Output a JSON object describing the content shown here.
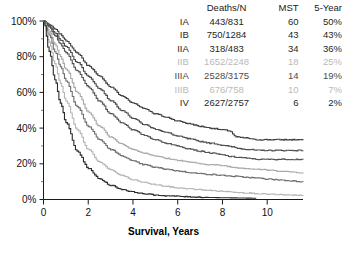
{
  "chart_data": {
    "type": "line",
    "title": "",
    "xlabel": "Survival, Years",
    "ylabel": "",
    "xlim": [
      0,
      11.6
    ],
    "ylim": [
      0,
      100
    ],
    "xticks": [
      "0",
      "2",
      "4",
      "6",
      "8",
      "10"
    ],
    "xtick_values": [
      0,
      2,
      4,
      6,
      8,
      10
    ],
    "yticks": [
      "0%",
      "20%",
      "40%",
      "60%",
      "80%",
      "100%"
    ],
    "ytick_values": [
      0,
      20,
      40,
      60,
      80,
      100
    ],
    "grid": false,
    "legend_position": "top-right",
    "series": [
      {
        "name": "IA",
        "color": "#3d3d3d",
        "deaths_n": "443/831",
        "mst": "60",
        "five_year": "50%",
        "x": [
          0,
          0.25,
          0.5,
          0.75,
          1,
          1.5,
          2,
          2.5,
          3,
          3.5,
          4,
          4.5,
          5,
          5.5,
          6,
          6.5,
          7,
          7.5,
          8,
          8.3,
          8.6,
          9,
          9.5,
          10,
          10.5,
          11,
          11.6
        ],
        "y": [
          100,
          98,
          95.5,
          92.5,
          89,
          82,
          75,
          69,
          63,
          58,
          54,
          51,
          48,
          46,
          44,
          42.5,
          41,
          40,
          39,
          38.5,
          35,
          34.5,
          33.5,
          33.5,
          33.5,
          33.5,
          33.5
        ]
      },
      {
        "name": "IB",
        "color": "#4a4a4a",
        "deaths_n": "750/1284",
        "mst": "43",
        "five_year": "43%",
        "x": [
          0,
          0.25,
          0.5,
          0.75,
          1,
          1.5,
          2,
          2.5,
          3,
          3.5,
          4,
          4.5,
          5,
          5.5,
          6,
          6.5,
          7,
          7.5,
          8,
          8.4,
          8.8,
          9.2,
          9.6,
          10,
          10.5,
          11,
          11.6
        ],
        "y": [
          100,
          97,
          93.5,
          89.5,
          85.5,
          77,
          69,
          62,
          55.5,
          50,
          45.5,
          42,
          39.5,
          37.5,
          35.5,
          34,
          32.5,
          31.5,
          30.5,
          29.5,
          28.5,
          28,
          27.5,
          27.5,
          27.5,
          27.5,
          27.5
        ]
      },
      {
        "name": "IIA",
        "color": "#525252",
        "deaths_n": "318/483",
        "mst": "34",
        "five_year": "36%",
        "x": [
          0,
          0.25,
          0.5,
          0.75,
          1,
          1.5,
          2,
          2.5,
          3,
          3.5,
          4,
          4.5,
          5,
          5.5,
          6,
          6.5,
          7,
          7.5,
          8,
          8.4,
          8.8,
          9.2,
          9.6,
          10,
          10.5,
          11,
          11.6
        ],
        "y": [
          100,
          96.5,
          92,
          87,
          82,
          72,
          63,
          55,
          48,
          43,
          39,
          36,
          33.5,
          31.5,
          30,
          28.5,
          27,
          26,
          25,
          24,
          23.5,
          23,
          22.5,
          22.5,
          22.5,
          22.5,
          22.5
        ]
      },
      {
        "name": "IIB",
        "color": "#a8a8a8",
        "deaths_n": "1652/2248",
        "mst": "18",
        "five_year": "25%",
        "x": [
          0,
          0.25,
          0.5,
          0.75,
          1,
          1.5,
          2,
          2.5,
          3,
          3.5,
          4,
          4.5,
          5,
          5.5,
          6,
          6.5,
          7,
          7.5,
          8,
          8.5,
          9,
          9.5,
          10,
          10.5,
          11,
          11.6
        ],
        "y": [
          100,
          94,
          87,
          80,
          73,
          60,
          49,
          41,
          35,
          31,
          28,
          26,
          24.5,
          23,
          22,
          21,
          20,
          19.5,
          19,
          18,
          17.5,
          17,
          16.5,
          16,
          15.5,
          15
        ]
      },
      {
        "name": "IIIA",
        "color": "#6e6e6e",
        "deaths_n": "2528/3175",
        "mst": "14",
        "five_year": "19%",
        "x": [
          0,
          0.25,
          0.5,
          0.75,
          1,
          1.5,
          2,
          2.5,
          3,
          3.5,
          4,
          4.5,
          5,
          5.5,
          6,
          6.5,
          7,
          7.5,
          8,
          8.5,
          9,
          9.5,
          10,
          10.5,
          11,
          11.6
        ],
        "y": [
          100,
          92,
          83,
          74.5,
          66.5,
          52,
          41,
          33.5,
          28,
          24.5,
          21.5,
          19.5,
          18,
          17,
          16,
          15.2,
          14.5,
          14,
          13.5,
          13,
          12.5,
          12,
          11.5,
          11,
          10.5,
          10
        ]
      },
      {
        "name": "IIIB",
        "color": "#b5b5b5",
        "deaths_n": "676/758",
        "mst": "10",
        "five_year": "7%",
        "x": [
          0,
          0.25,
          0.5,
          0.75,
          1,
          1.5,
          2,
          2.5,
          3,
          3.5,
          4,
          4.5,
          5,
          5.5,
          6,
          6.5,
          7,
          7.5,
          8,
          8.5,
          9,
          9.5,
          10,
          10.5,
          11,
          11.6
        ],
        "y": [
          100,
          88,
          76,
          65,
          55,
          39,
          28,
          21,
          16.5,
          13.5,
          11,
          9.5,
          8.3,
          7.3,
          6.5,
          6,
          5.5,
          5,
          4.6,
          4.2,
          3.8,
          3.4,
          3,
          2.7,
          2.4,
          2.2
        ]
      },
      {
        "name": "IV",
        "color": "#2b2b2b",
        "deaths_n": "2627/2757",
        "mst": "6",
        "five_year": "2%",
        "x": [
          0,
          0.25,
          0.5,
          0.75,
          1,
          1.5,
          2,
          2.5,
          3,
          3.5,
          4,
          4.5,
          5,
          5.5,
          6,
          6.5,
          7,
          7.5,
          8,
          8.5,
          9,
          9.5
        ],
        "y": [
          100,
          83,
          67,
          54,
          43,
          27,
          17.5,
          11.5,
          8,
          5.7,
          4.2,
          3.2,
          2.5,
          2.1,
          1.8,
          1.5,
          1.3,
          1.1,
          1.0,
          0.9,
          0.8,
          0.7
        ]
      }
    ]
  },
  "legend": {
    "headers": {
      "stage": "",
      "deaths": "Deaths/N",
      "mst": "MST",
      "five_year": "5-Year"
    },
    "rows": [
      {
        "stage": "IA",
        "deaths": "443/831",
        "mst": "60",
        "five_year": "50%",
        "color": "#1f1f1f"
      },
      {
        "stage": "IB",
        "deaths": "750/1284",
        "mst": "43",
        "five_year": "43%",
        "color": "#1f1f1f"
      },
      {
        "stage": "IIA",
        "deaths": "318/483",
        "mst": "34",
        "five_year": "36%",
        "color": "#1f1f1f"
      },
      {
        "stage": "IIB",
        "deaths": "1652/2248",
        "mst": "18",
        "five_year": "25%",
        "color": "#b9b9b9"
      },
      {
        "stage": "IIIA",
        "deaths": "2528/3175",
        "mst": "14",
        "five_year": "19%",
        "color": "#4d4d4d"
      },
      {
        "stage": "IIIB",
        "deaths": "676/758",
        "mst": "10",
        "five_year": "7%",
        "color": "#b9b9b9"
      },
      {
        "stage": "IV",
        "deaths": "2627/2757",
        "mst": "6",
        "five_year": "2%",
        "color": "#1f1f1f"
      }
    ]
  },
  "axes": {
    "x_title": "Survival, Years"
  }
}
